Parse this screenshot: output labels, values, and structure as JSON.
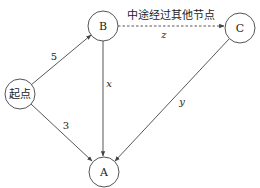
{
  "diagram": {
    "nodes": {
      "start": {
        "label": "起点",
        "cx": 20,
        "cy": 94,
        "r": 15
      },
      "B": {
        "label": "B",
        "cx": 103,
        "cy": 26,
        "r": 15
      },
      "C": {
        "label": "C",
        "cx": 240,
        "cy": 28,
        "r": 15
      },
      "A": {
        "label": "A",
        "cx": 104,
        "cy": 172,
        "r": 15
      }
    },
    "edges": {
      "start_B": {
        "from": "起点",
        "to": "B",
        "label": "5",
        "style": "solid"
      },
      "start_A": {
        "from": "起点",
        "to": "A",
        "label": "3",
        "style": "solid"
      },
      "B_A": {
        "from": "B",
        "to": "A",
        "label": "x",
        "style": "solid"
      },
      "B_C": {
        "from": "B",
        "to": "C",
        "label": "z",
        "style": "dashed",
        "note": "中途经过其他节点"
      },
      "C_A": {
        "from": "C",
        "to": "A",
        "label": "y",
        "style": "solid"
      }
    },
    "colors": {
      "stroke": "#444444",
      "text": "#222222",
      "background": "#ffffff"
    }
  }
}
